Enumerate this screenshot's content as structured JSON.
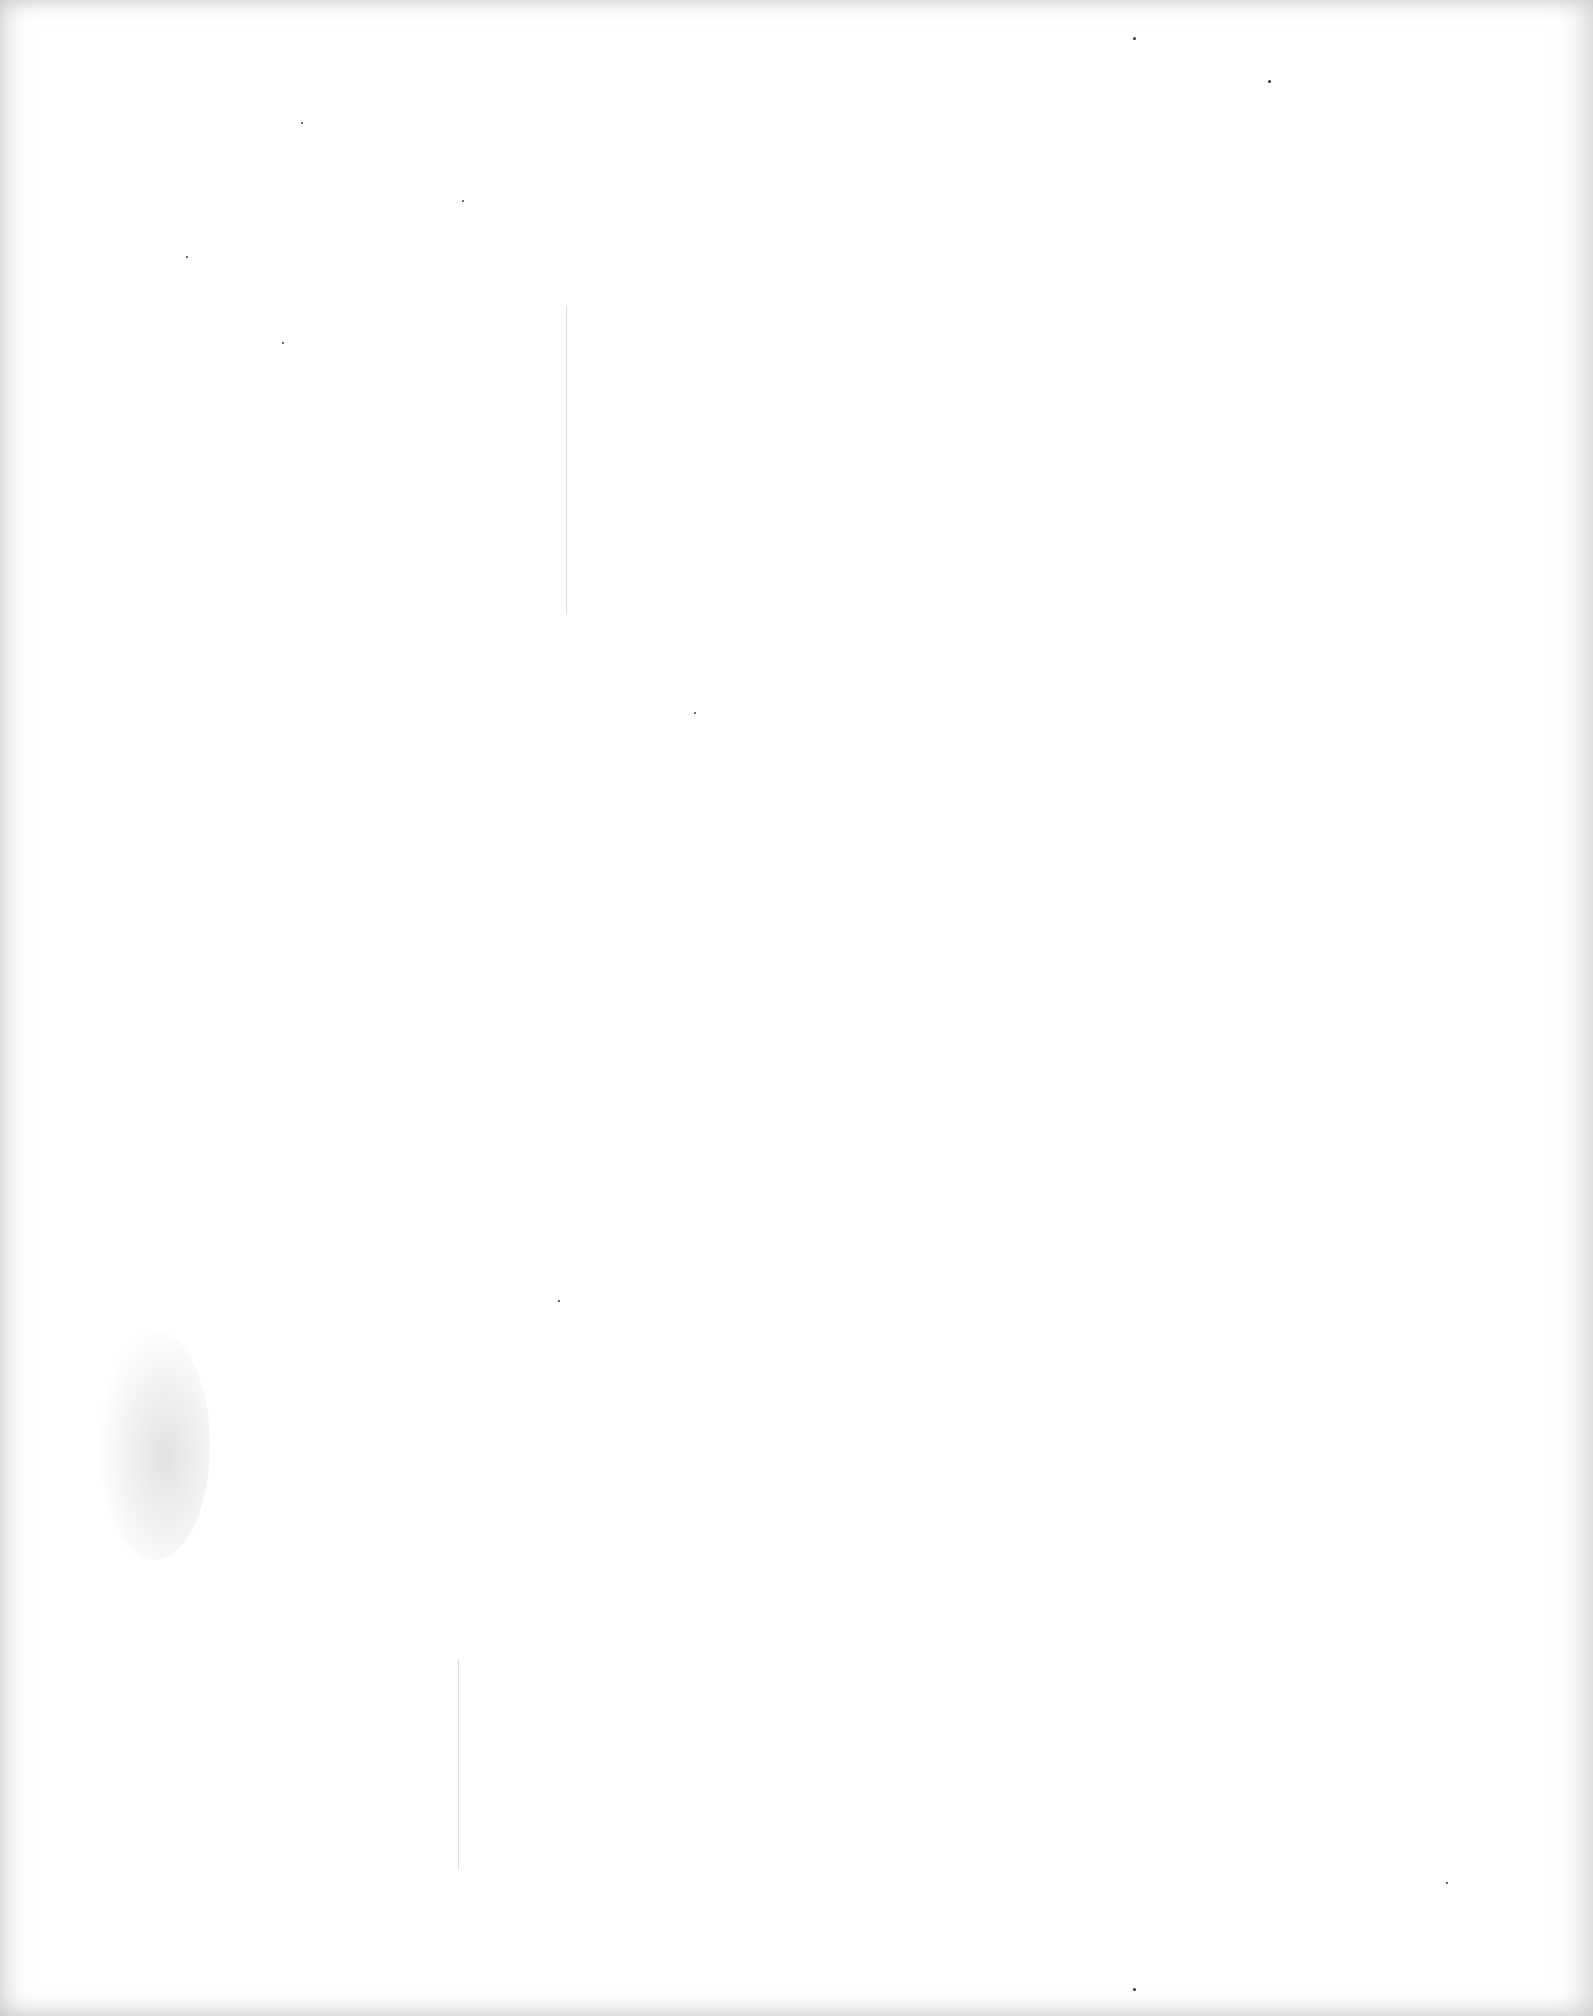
{
  "page": {
    "width": 1593,
    "height": 2016,
    "background": "#ffffff",
    "content": ""
  },
  "artifacts": {
    "scan_lines": [
      {
        "x": 566,
        "y": 305,
        "height": 310
      },
      {
        "x": 458,
        "y": 1660,
        "height": 210
      }
    ],
    "smudge": {
      "x": 100,
      "y": 1330,
      "width": 110,
      "height": 230
    },
    "specks": [
      {
        "x": 1133,
        "y": 37,
        "size": 3
      },
      {
        "x": 1268,
        "y": 80,
        "size": 3
      },
      {
        "x": 301,
        "y": 122,
        "size": 2
      },
      {
        "x": 462,
        "y": 200,
        "size": 2
      },
      {
        "x": 282,
        "y": 342,
        "size": 2
      },
      {
        "x": 186,
        "y": 256,
        "size": 2
      },
      {
        "x": 694,
        "y": 712,
        "size": 2
      },
      {
        "x": 558,
        "y": 1300,
        "size": 2
      },
      {
        "x": 1133,
        "y": 1988,
        "size": 3
      },
      {
        "x": 1446,
        "y": 1882,
        "size": 2
      }
    ]
  }
}
